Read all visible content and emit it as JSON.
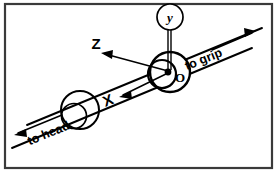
{
  "figure": {
    "kind": "line-art-diagram",
    "background_color": "#ffffff",
    "ink_color": "#000000",
    "border_color": "#3a3a3a",
    "width": 277,
    "height": 172
  },
  "labels": {
    "axis_y": "y",
    "axis_z": "Z",
    "axis_x": "X",
    "origin": "O",
    "end_head": "to head",
    "end_grip": "to grip"
  },
  "geometry": {
    "rod_direction_deg": -25,
    "origin_point": [
      170,
      72
    ],
    "collar_center": [
      78,
      112
    ],
    "joint_center": [
      170,
      72
    ]
  }
}
